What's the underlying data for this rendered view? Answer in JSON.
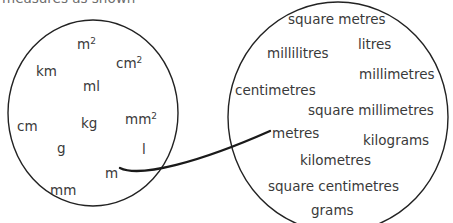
{
  "diagram": {
    "type": "venn-mapping",
    "title_fragment": "measures as shown",
    "stroke_color": "#222222",
    "text_color": "#3a3a3a",
    "background": "#ffffff",
    "left_circle": {
      "name": "abbreviations-circle",
      "cx": 93,
      "cy": 113,
      "rx": 85,
      "ry": 93,
      "items": [
        {
          "text": "m",
          "sup": "2",
          "x": 77,
          "y": 38
        },
        {
          "text": "cm",
          "sup": "2",
          "x": 116,
          "y": 57
        },
        {
          "text": "km",
          "sup": "",
          "x": 36,
          "y": 65
        },
        {
          "text": "ml",
          "sup": "",
          "x": 83,
          "y": 80
        },
        {
          "text": "mm",
          "sup": "2",
          "x": 125,
          "y": 113
        },
        {
          "text": "cm",
          "sup": "",
          "x": 17,
          "y": 120
        },
        {
          "text": "kg",
          "sup": "",
          "x": 81,
          "y": 117
        },
        {
          "text": "g",
          "sup": "",
          "x": 57,
          "y": 142
        },
        {
          "text": "l",
          "sup": "",
          "x": 142,
          "y": 143
        },
        {
          "text": "m",
          "sup": "",
          "x": 105,
          "y": 167
        },
        {
          "text": "mm",
          "sup": "",
          "x": 50,
          "y": 184
        }
      ]
    },
    "right_circle": {
      "name": "full-words-circle",
      "cx": 338,
      "cy": 117,
      "rx": 110,
      "ry": 115,
      "items": [
        {
          "text": "square metres",
          "x": 288,
          "y": 13
        },
        {
          "text": "litres",
          "x": 358,
          "y": 38
        },
        {
          "text": "millilitres",
          "x": 267,
          "y": 47
        },
        {
          "text": "millimetres",
          "x": 359,
          "y": 68
        },
        {
          "text": "centimetres",
          "x": 235,
          "y": 84
        },
        {
          "text": "square millimetres",
          "x": 308,
          "y": 104
        },
        {
          "text": "metres",
          "x": 272,
          "y": 127
        },
        {
          "text": "kilograms",
          "x": 363,
          "y": 134
        },
        {
          "text": "kilometres",
          "x": 300,
          "y": 154
        },
        {
          "text": "square centimetres",
          "x": 268,
          "y": 180
        },
        {
          "text": "grams",
          "x": 311,
          "y": 204
        }
      ]
    },
    "connector": {
      "name": "m-to-metres-connector",
      "from_label": "m",
      "to_label": "metres",
      "path": "M 120 168 C 140 178, 200 162, 270 131",
      "stroke_width": 2.4
    }
  }
}
